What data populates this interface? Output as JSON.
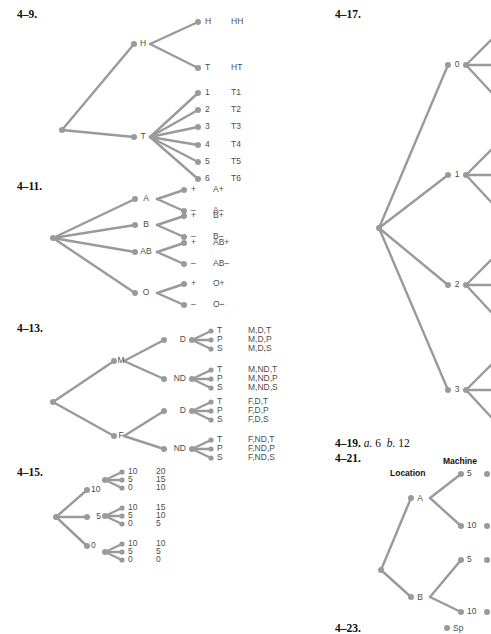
{
  "page": {
    "width": 491,
    "height": 632,
    "background": "#ffffff",
    "line_color": "#9a9a9a",
    "label_color": "#4d4d4d",
    "text_color": "#111111"
  },
  "problems": {
    "p4_9": {
      "number": "4–9.",
      "type": "tree",
      "root_label": "",
      "level1": [
        {
          "label": "H",
          "children": [
            {
              "label": "H",
              "outcome": "HH"
            },
            {
              "label": "T",
              "outcome": "HT"
            }
          ]
        },
        {
          "label": "T",
          "children": [
            {
              "label": "1",
              "outcome": "T1"
            },
            {
              "label": "2",
              "outcome": "T2"
            },
            {
              "label": "3",
              "outcome": "T3"
            },
            {
              "label": "4",
              "outcome": "T4"
            },
            {
              "label": "5",
              "outcome": "T5"
            },
            {
              "label": "6",
              "outcome": "T6"
            }
          ]
        }
      ]
    },
    "p4_11": {
      "number": "4–11.",
      "type": "tree",
      "level1": [
        {
          "label": "A",
          "children": [
            {
              "label": "+",
              "outcome": "A+"
            },
            {
              "label": "–",
              "outcome": "A–"
            }
          ]
        },
        {
          "label": "B",
          "children": [
            {
              "label": "+",
              "outcome": "B+"
            },
            {
              "label": "–",
              "outcome": "B–"
            }
          ]
        },
        {
          "label": "AB",
          "children": [
            {
              "label": "+",
              "outcome": "AB+"
            },
            {
              "label": "–",
              "outcome": "AB–"
            }
          ]
        },
        {
          "label": "O",
          "children": [
            {
              "label": "+",
              "outcome": "O+"
            },
            {
              "label": "–",
              "outcome": "O–"
            }
          ]
        }
      ]
    },
    "p4_13": {
      "number": "4–13.",
      "type": "tree",
      "level1": [
        {
          "label": "M",
          "children": [
            {
              "label": "D",
              "leaves": [
                {
                  "label": "T",
                  "outcome": "M,D,T"
                },
                {
                  "label": "P",
                  "outcome": "M,D,P"
                },
                {
                  "label": "S",
                  "outcome": "M,D,S"
                }
              ]
            },
            {
              "label": "ND",
              "leaves": [
                {
                  "label": "T",
                  "outcome": "M,ND,T"
                },
                {
                  "label": "P",
                  "outcome": "M,ND,P"
                },
                {
                  "label": "S",
                  "outcome": "M,ND,S"
                }
              ]
            }
          ]
        },
        {
          "label": "F",
          "children": [
            {
              "label": "D",
              "leaves": [
                {
                  "label": "T",
                  "outcome": "F,D,T"
                },
                {
                  "label": "P",
                  "outcome": "F,D,P"
                },
                {
                  "label": "S",
                  "outcome": "F,D,S"
                }
              ]
            },
            {
              "label": "ND",
              "leaves": [
                {
                  "label": "T",
                  "outcome": "F,ND,T"
                },
                {
                  "label": "P",
                  "outcome": "F,ND,P"
                },
                {
                  "label": "S",
                  "outcome": "F,ND,S"
                }
              ]
            }
          ]
        }
      ]
    },
    "p4_15": {
      "number": "4–15.",
      "type": "tree",
      "level1": [
        {
          "label": "10",
          "children": [
            {
              "label": "10",
              "outcome": "20"
            },
            {
              "label": "5",
              "outcome": "15"
            },
            {
              "label": "0",
              "outcome": "10"
            }
          ]
        },
        {
          "label": "5",
          "children": [
            {
              "label": "10",
              "outcome": "15"
            },
            {
              "label": "5",
              "outcome": "10"
            },
            {
              "label": "0",
              "outcome": "5"
            }
          ]
        },
        {
          "label": "0",
          "children": [
            {
              "label": "10",
              "outcome": "10"
            },
            {
              "label": "5",
              "outcome": "5"
            },
            {
              "label": "0",
              "outcome": "0"
            }
          ]
        }
      ]
    },
    "p4_17": {
      "number": "4–17.",
      "type": "tree",
      "note": "right portion cropped by page edge",
      "level1": [
        {
          "label": "0"
        },
        {
          "label": "1"
        },
        {
          "label": "2"
        },
        {
          "label": "3"
        }
      ]
    },
    "p4_19": {
      "number": "4–19.",
      "parts": [
        {
          "letter": "a.",
          "value": "6"
        },
        {
          "letter": "b.",
          "value": "12"
        }
      ]
    },
    "p4_21": {
      "number": "4–21.",
      "type": "tree",
      "col_headers": [
        {
          "label": "Location"
        },
        {
          "label": "Machine"
        }
      ],
      "level1": [
        {
          "label": "A",
          "children": [
            {
              "label": "5"
            },
            {
              "label": "10"
            }
          ]
        },
        {
          "label": "B",
          "children": [
            {
              "label": "5"
            },
            {
              "label": "10"
            }
          ]
        }
      ]
    },
    "p4_23": {
      "number": "4–23.",
      "note": "cropped at bottom edge",
      "first_leaf": "Sp"
    }
  }
}
